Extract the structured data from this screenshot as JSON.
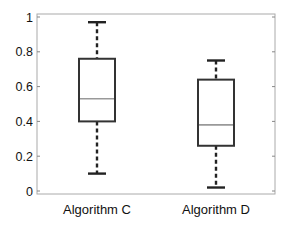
{
  "chart_data": {
    "type": "box",
    "title": "",
    "xlabel": "",
    "ylabel": "",
    "ylim": [
      0,
      1
    ],
    "yticks": [
      0,
      0.2,
      0.4,
      0.6,
      0.8,
      1
    ],
    "ytick_labels": [
      "0",
      "0.2",
      "0.4",
      "0.6",
      "0.8",
      "1"
    ],
    "grid": false,
    "legend": null,
    "categories": [
      "Algorithm C",
      "Algorithm D"
    ],
    "series": [
      {
        "name": "Algorithm C",
        "whisker_low": 0.1,
        "q1": 0.4,
        "median": 0.53,
        "q3": 0.76,
        "whisker_high": 0.97
      },
      {
        "name": "Algorithm D",
        "whisker_low": 0.02,
        "q1": 0.26,
        "median": 0.38,
        "q3": 0.64,
        "whisker_high": 0.75
      }
    ],
    "colors": {
      "box": "#333333",
      "median": "#999999",
      "whisker": "#222222",
      "frame": "#aaaaaa"
    }
  }
}
